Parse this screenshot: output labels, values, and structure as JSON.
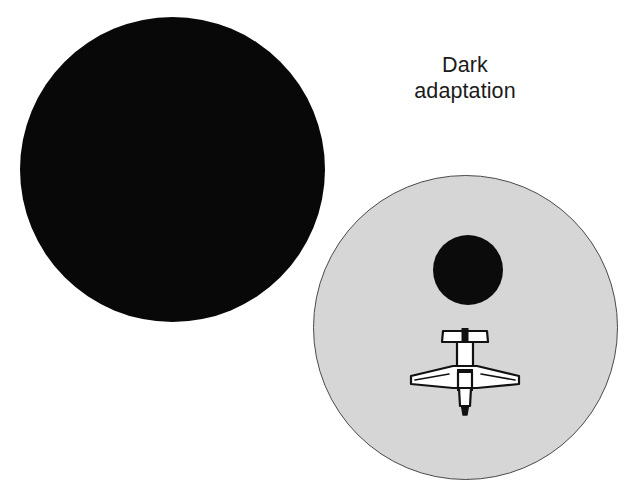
{
  "figure": {
    "width": 638,
    "height": 492,
    "background_color": "#ffffff"
  },
  "caption": {
    "line1": "Dark",
    "line2": "adaptation",
    "text": "Dark adaptation",
    "color": "#1b1b1b"
  },
  "shapes": {
    "dark_circle": {
      "label": "fully dark field of view",
      "center_x": 172,
      "center_y": 170,
      "diameter": 305,
      "fill_color": "#080808"
    },
    "gray_circle": {
      "label": "dark adapted field of view",
      "center_x": 465,
      "center_y": 327,
      "diameter": 305,
      "fill_color": "#d6d6d6",
      "outline_color": "#4a4a4a"
    },
    "blind_spot": {
      "label": "central blind spot",
      "center_x": 468,
      "center_y": 270,
      "diameter": 70,
      "fill_color": "#0b0b0b"
    },
    "airplane": {
      "label": "light aircraft top view seen in peripheral vision",
      "center_x": 465,
      "center_y": 374,
      "wing_span": 108,
      "stabilizer_span": 42,
      "fill_color": "#ffffff",
      "outline_color": "#111111"
    }
  }
}
